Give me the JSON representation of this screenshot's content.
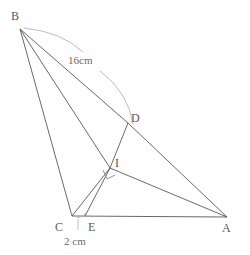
{
  "figure": {
    "canvas": {
      "width": 250,
      "height": 255
    },
    "stroke_color": "#555555",
    "arc_color": "#b0b0b0",
    "label_color": "#5a5a5a",
    "measure_color": "#6b6b6b"
  },
  "points": {
    "B": {
      "label": "B",
      "x": 20,
      "y": 29,
      "label_x": 11,
      "label_y": 10
    },
    "C": {
      "label": "C",
      "x": 72,
      "y": 216,
      "label_x": 55,
      "label_y": 221
    },
    "E": {
      "label": "E",
      "x": 85,
      "y": 216,
      "label_x": 88,
      "label_y": 221
    },
    "A": {
      "label": "A",
      "x": 227,
      "y": 217,
      "label_x": 222,
      "label_y": 222
    },
    "D": {
      "label": "D",
      "x": 128,
      "y": 123,
      "label_x": 131,
      "label_y": 112
    },
    "I": {
      "label": "I",
      "x": 110,
      "y": 168,
      "label_x": 115,
      "label_y": 157
    }
  },
  "segments": [
    {
      "name": "segment-BC",
      "from": "B",
      "to": "C"
    },
    {
      "name": "segment-BI",
      "from": "B",
      "to": "I"
    },
    {
      "name": "segment-BD",
      "from": "B",
      "to": "D"
    },
    {
      "name": "segment-DA",
      "from": "D",
      "to": "A"
    },
    {
      "name": "segment-CA",
      "from": "C",
      "to": "A"
    },
    {
      "name": "segment-CI",
      "from": "C",
      "to": "I"
    },
    {
      "name": "segment-EI",
      "from": "E",
      "to": "I"
    },
    {
      "name": "segment-ID",
      "from": "I",
      "to": "D"
    },
    {
      "name": "segment-IA",
      "from": "I",
      "to": "A"
    },
    {
      "name": "segment-BE",
      "from": "B",
      "to": "E"
    }
  ],
  "measurements": {
    "side_bd": {
      "text": "16cm",
      "x": 68,
      "y": 55
    },
    "side_ce": {
      "text": "2 cm",
      "x": 64,
      "y": 236
    }
  },
  "markers": {
    "right_angle": {
      "name": "right-angle-marker",
      "x": 110,
      "y": 168,
      "size": 8
    },
    "arc_bd": {
      "name": "arc-16cm",
      "description": "measurement arc from B to D"
    },
    "arc_ce": {
      "name": "arc-2cm",
      "description": "measurement arc under C to E"
    }
  }
}
